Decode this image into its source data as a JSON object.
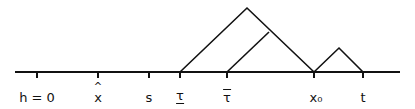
{
  "diagram": {
    "type": "tree-on-timeline",
    "baseline": {
      "x_start": 15,
      "x_end": 400,
      "y": 72
    },
    "ticks": [
      {
        "id": "h0",
        "x": 37,
        "label": "h = 0"
      },
      {
        "id": "xhat",
        "x": 98,
        "label": "x",
        "accent": "hat"
      },
      {
        "id": "s",
        "x": 149,
        "label": "s"
      },
      {
        "id": "tau-under",
        "x": 180,
        "label": "τ",
        "accent": "underline"
      },
      {
        "id": "tau-over",
        "x": 227,
        "label": "τ",
        "accent": "overline"
      },
      {
        "id": "x0",
        "x": 314,
        "label": "x₀"
      },
      {
        "id": "t",
        "x": 363,
        "label": "t"
      }
    ],
    "branches": [
      {
        "name": "big-triangle-left",
        "from": [
          180,
          72
        ],
        "to": [
          247,
          8
        ]
      },
      {
        "name": "big-triangle-right",
        "from": [
          247,
          8
        ],
        "to": [
          314,
          72
        ]
      },
      {
        "name": "inner-branch",
        "from": [
          227,
          72
        ],
        "to": [
          269,
          32
        ]
      },
      {
        "name": "small-triangle-left",
        "from": [
          314,
          72
        ],
        "to": [
          339,
          48
        ]
      },
      {
        "name": "small-triangle-right",
        "from": [
          339,
          48
        ],
        "to": [
          363,
          72
        ]
      }
    ],
    "stroke_color": "#111111"
  },
  "labels": {
    "h0": "h = 0",
    "xhat": "x",
    "xhat_accent": "^",
    "s": "s",
    "tau_under": "τ",
    "tau_over": "τ",
    "x0": "x₀",
    "t": "t"
  }
}
